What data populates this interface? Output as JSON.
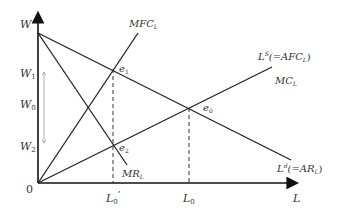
{
  "diagram": {
    "type": "monopsony-labor-market",
    "colors": {
      "line": "#222222",
      "text": "#333333",
      "arrow_gray": "#999999"
    },
    "axes": {
      "y_label": "W",
      "x_label": "L",
      "origin_label": "0"
    },
    "y_ticks": {
      "W1": "W",
      "W1_sub": "1",
      "W0": "W",
      "W0_sub": "0",
      "W2": "W",
      "W2_sub": "2"
    },
    "x_ticks": {
      "L0prime": "L",
      "L0prime_sub": "0",
      "L0prime_mark": "’",
      "L0": "L",
      "L0_sub": "0"
    },
    "curves": {
      "mfc": {
        "main": "MFC",
        "sub": "L"
      },
      "supply": {
        "main": "L",
        "sup": "S",
        "rest": "(=AFC",
        "sub": "L",
        "close": ")"
      },
      "mc": {
        "main": "MC",
        "sub": "L"
      },
      "demand": {
        "main": "L",
        "sup": "d",
        "rest": "(=AR",
        "sub": "L",
        "close": ")"
      },
      "mr": {
        "main": "MR",
        "sub": "L"
      }
    },
    "points": {
      "e1": {
        "main": "e",
        "sub": "1"
      },
      "e0": {
        "main": "e",
        "sub": "0"
      },
      "e2": {
        "main": "e",
        "sub": "2"
      }
    }
  }
}
